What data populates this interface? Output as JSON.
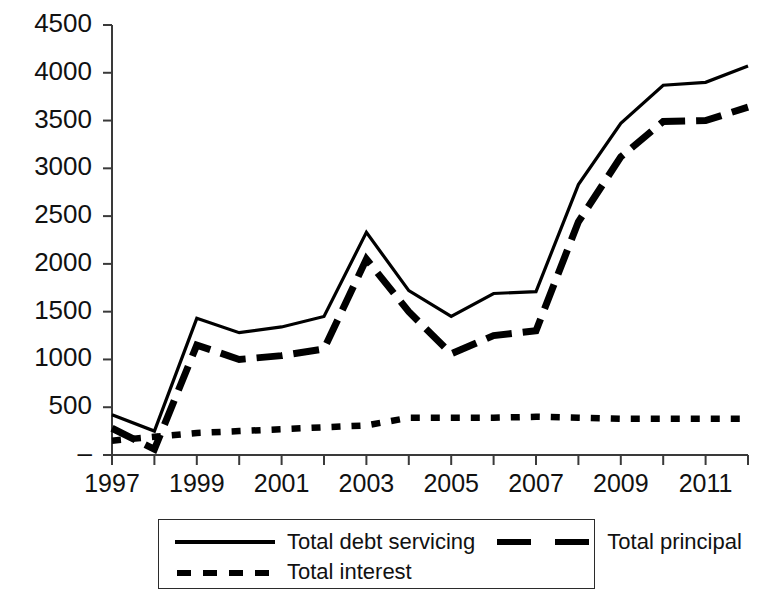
{
  "chart_data": {
    "type": "line",
    "title": "",
    "xlabel": "",
    "ylabel": "",
    "x": [
      1997,
      1998,
      1999,
      2000,
      2001,
      2002,
      2003,
      2004,
      2005,
      2006,
      2007,
      2008,
      2009,
      2010,
      2011,
      2012
    ],
    "xlim": [
      1997,
      2012
    ],
    "ylim": [
      0,
      4500
    ],
    "ytick_values": [
      0,
      500,
      1000,
      1500,
      2000,
      2500,
      3000,
      3500,
      4000,
      4500
    ],
    "ytick_labels": [
      "–",
      "500",
      "1000",
      "1500",
      "2000",
      "2500",
      "3000",
      "3500",
      "4000",
      "4500"
    ],
    "xtick_values": [
      1997,
      1998,
      1999,
      2000,
      2001,
      2002,
      2003,
      2004,
      2005,
      2006,
      2007,
      2008,
      2009,
      2010,
      2011,
      2012
    ],
    "xtick_labels": [
      "1997",
      "",
      "1999",
      "",
      "2001",
      "",
      "2003",
      "",
      "2005",
      "",
      "2007",
      "",
      "2009",
      "",
      "2011",
      ""
    ],
    "grid": false,
    "legend_position": "below-center",
    "series": [
      {
        "name": "Total debt servicing",
        "style": "solid",
        "color": "#000000",
        "values": [
          420,
          250,
          1430,
          1280,
          1340,
          1450,
          2330,
          1720,
          1450,
          1690,
          1710,
          2830,
          3470,
          3870,
          3900,
          4070
        ]
      },
      {
        "name": "Total principal",
        "style": "long-dash",
        "color": "#000000",
        "values": [
          280,
          60,
          1150,
          1000,
          1040,
          1110,
          2050,
          1500,
          1060,
          1250,
          1300,
          2440,
          3120,
          3490,
          3500,
          3640
        ]
      },
      {
        "name": "Total interest",
        "style": "short-dash",
        "color": "#000000",
        "values": [
          150,
          190,
          230,
          250,
          270,
          290,
          310,
          390,
          390,
          390,
          400,
          390,
          380,
          380,
          380,
          380
        ]
      }
    ]
  },
  "legend": {
    "entries": [
      {
        "label": "Total debt servicing",
        "style": "solid"
      },
      {
        "label": "Total principal",
        "style": "long-dash"
      },
      {
        "label": "Total interest",
        "style": "short-dash"
      }
    ]
  }
}
